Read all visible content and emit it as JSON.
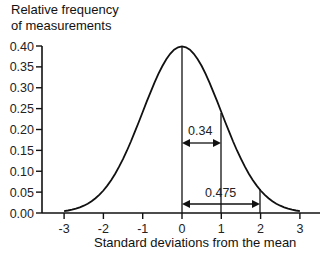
{
  "chart_data": {
    "type": "line",
    "title": "",
    "ylabel_lines": [
      "Relative frequency",
      "of measurements"
    ],
    "xlabel": "Standard deviations from the mean",
    "x_ticks": [
      "-3",
      "-2",
      "-1",
      "0",
      "1",
      "2",
      "3"
    ],
    "y_ticks": [
      "0.40",
      "0.35",
      "0.30",
      "0.25",
      "0.20",
      "0.15",
      "0.10",
      "0.05",
      "0.00"
    ],
    "xlim": [
      -3.3,
      3.5
    ],
    "ylim": [
      0,
      0.4
    ],
    "x": [
      -3,
      -2.5,
      -2,
      -1.5,
      -1,
      -0.5,
      0,
      0.5,
      1,
      1.5,
      2,
      2.5,
      3
    ],
    "values": [
      0.004,
      0.018,
      0.054,
      0.13,
      0.242,
      0.352,
      0.399,
      0.352,
      0.242,
      0.13,
      0.054,
      0.018,
      0.004
    ],
    "annotations": [
      {
        "text": "0.34",
        "from": 0,
        "to": 1,
        "description": "area between mean and +1 SD"
      },
      {
        "text": "0.475",
        "from": 0,
        "to": 2,
        "description": "area between mean and +2 SD"
      }
    ],
    "vertical_lines_at": [
      0,
      1,
      2
    ],
    "grid": false,
    "legend": null
  }
}
